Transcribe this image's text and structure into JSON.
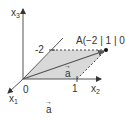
{
  "diagram": {
    "type": "3d-coordinate-system",
    "axes": {
      "x1": {
        "label": "x",
        "subscript": "1"
      },
      "x2": {
        "label": "x",
        "subscript": "2"
      },
      "x3": {
        "label": "x",
        "subscript": "3"
      }
    },
    "origin_label": "0",
    "ticks": {
      "x1": "-2",
      "x2": "1"
    },
    "point": {
      "label": "A(−2 | 1 | 0)"
    },
    "vector": {
      "label": "a",
      "arrow_glyph": "→"
    },
    "caption": {
      "label": "a",
      "arrow_glyph": "→"
    },
    "colors": {
      "axis": "#555555",
      "shade": "#d9d9d9",
      "dashed": "#444444",
      "vector": "#555555",
      "point": "#111111",
      "text": "#333333"
    }
  }
}
